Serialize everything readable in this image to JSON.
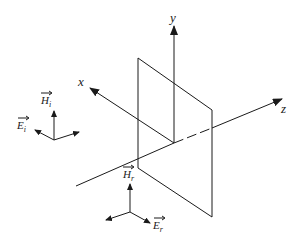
{
  "diagram": {
    "type": "reflection-geometry",
    "axes": {
      "x": {
        "label": "x"
      },
      "y": {
        "label": "y"
      },
      "z": {
        "label": "z"
      }
    },
    "incident_field": {
      "H_label": "H",
      "H_sub": "i",
      "E_label": "E",
      "E_sub": "i"
    },
    "reflected_field": {
      "H_label": "H",
      "H_sub": "r",
      "E_label": "E",
      "E_sub": "r"
    },
    "colors": {
      "line": "#1a1a1a",
      "background": "#ffffff"
    }
  }
}
